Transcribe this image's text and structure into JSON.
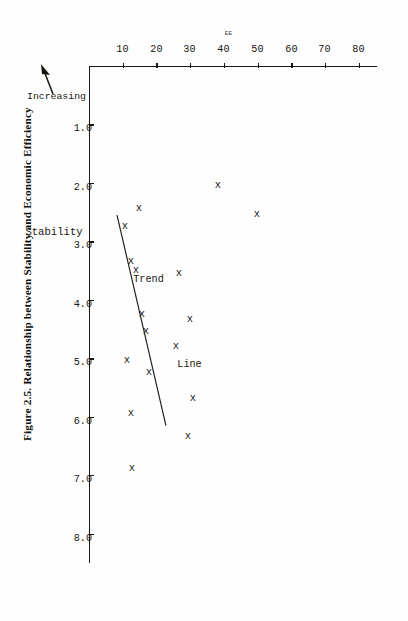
{
  "figure": {
    "caption": "Figure 2.5.  Relationship between Stability and Economic Efficiency"
  },
  "annotations": {
    "increasing_label": "Increasing",
    "arrow_icon": "left-arrow-icon",
    "trend_label_part1": "Trend",
    "trend_label_part2": "Line"
  },
  "chart_data": {
    "type": "scatter",
    "title": "Figure 2.5.  Relationship between Stability and Economic Efficiency",
    "xlabel": "Stability",
    "ylabel": "EE",
    "xlim": [
      0.0,
      8.5
    ],
    "ylim": [
      0,
      85
    ],
    "grid": false,
    "legend": null,
    "xticks": [
      "1.0",
      "2.0",
      "3.0",
      "4.0",
      "5.0",
      "6.0",
      "7.0",
      "8.0"
    ],
    "xtick_values": [
      1.0,
      2.0,
      3.0,
      4.0,
      5.0,
      6.0,
      7.0,
      8.0
    ],
    "yticks": [
      "10",
      "20",
      "30",
      "40",
      "50",
      "60",
      "70",
      "80"
    ],
    "ytick_values": [
      10,
      20,
      30,
      40,
      50,
      60,
      70,
      80
    ],
    "marker_symbol": "x",
    "points": [
      {
        "x": 2.05,
        "y": 38.0
      },
      {
        "x": 2.55,
        "y": 49.5
      },
      {
        "x": 2.45,
        "y": 14.5
      },
      {
        "x": 2.75,
        "y": 10.5
      },
      {
        "x": 3.35,
        "y": 12.0
      },
      {
        "x": 3.5,
        "y": 13.5
      },
      {
        "x": 3.55,
        "y": 26.5
      },
      {
        "x": 4.25,
        "y": 15.5
      },
      {
        "x": 4.35,
        "y": 29.5
      },
      {
        "x": 4.55,
        "y": 16.5
      },
      {
        "x": 4.8,
        "y": 25.5
      },
      {
        "x": 5.05,
        "y": 11.0
      },
      {
        "x": 5.25,
        "y": 17.5
      },
      {
        "x": 5.7,
        "y": 30.5
      },
      {
        "x": 5.95,
        "y": 12.0
      },
      {
        "x": 6.35,
        "y": 29.0
      },
      {
        "x": 6.9,
        "y": 12.5
      }
    ],
    "trend_line": {
      "label": "Trend Line",
      "x_start": 2.55,
      "y_start": 8.0,
      "x_end": 6.15,
      "y_end": 22.5
    }
  }
}
